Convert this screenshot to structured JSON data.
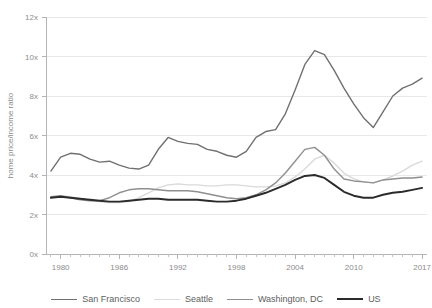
{
  "chart_data": {
    "type": "line",
    "title": "",
    "subtitle": "",
    "xlabel": "",
    "ylabel": "home price/income ratio",
    "xlim": [
      1978.5,
      2017.5
    ],
    "ylim": [
      0,
      12
    ],
    "grid": true,
    "legend_position": "bottom",
    "y_ticks": [
      0,
      2,
      4,
      6,
      8,
      10,
      12
    ],
    "y_tick_labels": [
      "0x",
      "2x",
      "4x",
      "6x",
      "8x",
      "10x",
      "12x"
    ],
    "x_ticks": [
      1980,
      1986,
      1992,
      1998,
      2004,
      2010,
      2017
    ],
    "x_tick_labels": [
      "1980",
      "1986",
      "1992",
      "1998",
      "2004",
      "2010",
      "2017"
    ],
    "x_minor_tick_step": 1,
    "x": [
      1979,
      1980,
      1981,
      1982,
      1983,
      1984,
      1985,
      1986,
      1987,
      1988,
      1989,
      1990,
      1991,
      1992,
      1993,
      1994,
      1995,
      1996,
      1997,
      1998,
      1999,
      2000,
      2001,
      2002,
      2003,
      2004,
      2005,
      2006,
      2007,
      2008,
      2009,
      2010,
      2011,
      2012,
      2013,
      2014,
      2015,
      2016,
      2017
    ],
    "series": [
      {
        "name": "San Francisco",
        "color": "#707070",
        "width": 1.4,
        "values": [
          4.2,
          4.9,
          5.1,
          5.05,
          4.8,
          4.65,
          4.7,
          4.5,
          4.35,
          4.3,
          4.5,
          5.3,
          5.9,
          5.7,
          5.6,
          5.55,
          5.3,
          5.2,
          5.0,
          4.9,
          5.2,
          5.9,
          6.2,
          6.3,
          7.1,
          8.3,
          9.6,
          10.3,
          10.1,
          9.3,
          8.4,
          7.6,
          6.9,
          6.4,
          7.2,
          8.0,
          8.4,
          8.6,
          8.9
        ]
      },
      {
        "name": "Seattle",
        "color": "#d9d9d9",
        "width": 1.4,
        "values": [
          2.85,
          2.95,
          2.9,
          2.8,
          2.7,
          2.65,
          2.6,
          2.6,
          2.65,
          2.85,
          3.1,
          3.35,
          3.5,
          3.55,
          3.5,
          3.5,
          3.45,
          3.45,
          3.5,
          3.5,
          3.45,
          3.4,
          3.4,
          3.45,
          3.6,
          3.9,
          4.3,
          4.8,
          5.0,
          4.6,
          4.1,
          3.8,
          3.65,
          3.6,
          3.75,
          3.95,
          4.2,
          4.5,
          4.7
        ]
      },
      {
        "name": "Washington, DC",
        "color": "#8f8f8f",
        "width": 1.4,
        "values": [
          2.9,
          2.95,
          2.85,
          2.75,
          2.7,
          2.7,
          2.85,
          3.1,
          3.25,
          3.3,
          3.3,
          3.25,
          3.2,
          3.2,
          3.2,
          3.15,
          3.05,
          2.95,
          2.85,
          2.8,
          2.85,
          3.0,
          3.25,
          3.6,
          4.1,
          4.7,
          5.3,
          5.4,
          5.0,
          4.3,
          3.8,
          3.7,
          3.65,
          3.6,
          3.75,
          3.8,
          3.85,
          3.85,
          3.9
        ]
      },
      {
        "name": "US",
        "color": "#2b2b2b",
        "width": 1.9,
        "values": [
          2.85,
          2.9,
          2.85,
          2.8,
          2.75,
          2.7,
          2.65,
          2.65,
          2.7,
          2.75,
          2.8,
          2.8,
          2.75,
          2.75,
          2.75,
          2.75,
          2.7,
          2.65,
          2.65,
          2.7,
          2.8,
          2.95,
          3.1,
          3.3,
          3.5,
          3.75,
          3.95,
          4.0,
          3.85,
          3.5,
          3.15,
          2.95,
          2.85,
          2.85,
          3.0,
          3.1,
          3.15,
          3.25,
          3.35
        ]
      }
    ]
  },
  "legend": {
    "items": [
      {
        "label": "San Francisco",
        "color": "#707070",
        "width": "1.6px"
      },
      {
        "label": "Seattle",
        "color": "#dcdcdc",
        "width": "1.6px"
      },
      {
        "label": "Washington, DC",
        "color": "#8f8f8f",
        "width": "1.6px"
      },
      {
        "label": "US",
        "color": "#2b2b2b",
        "width": "2.2px"
      }
    ]
  }
}
